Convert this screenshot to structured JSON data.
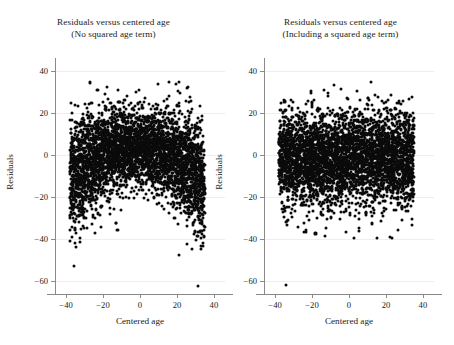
{
  "figure": {
    "background": "#ffffff",
    "point_color": "#0b0b0b",
    "axis_color": "#8a8a8a",
    "grid_color": "#f0eeec"
  },
  "chart_data": [
    {
      "type": "scatter",
      "panel": "left",
      "title": "Residuals versus centered age",
      "subtitle": "(No squared age term)",
      "xlabel": "Centered age",
      "ylabel": "Residuals",
      "xlim": [
        -46,
        46
      ],
      "ylim": [
        -66,
        46
      ],
      "xticks": [
        -40,
        -20,
        0,
        20,
        40
      ],
      "xticklabels": [
        "−40",
        "−20",
        "0",
        "20",
        "40"
      ],
      "yticks": [
        -60,
        -40,
        -20,
        0,
        20,
        40
      ],
      "yticklabels": [
        "−60",
        "−40",
        "−20",
        "0",
        "20",
        "40"
      ],
      "grid": "horizontal",
      "legend": "none",
      "n_points_approx": 4000,
      "x_data_range": [
        -38,
        35
      ],
      "description": "Dense black point cloud spanning centered age -38 to 35. Residual spread is asymmetric: the lower boundary of the cloud is arched (inverted-U), reaching about -50 near the edges and only about -18 near the centre, indicating an unmodelled quadratic age effect. Upper boundary rises to roughly +25 to +45. A few isolated low outliers near -60.",
      "shape": "arched",
      "upper_edge_centre": 24,
      "upper_edge_edges": 14,
      "lower_edge_centre": -17,
      "lower_edge_edges": -47,
      "min_residual": -60,
      "max_residual": 45
    },
    {
      "type": "scatter",
      "panel": "right",
      "title": "Residuals versus centered age",
      "subtitle": "(Including a squared age term)",
      "xlabel": "Centered age",
      "ylabel": "Residuals",
      "xlim": [
        -46,
        46
      ],
      "ylim": [
        -66,
        46
      ],
      "xticks": [
        -40,
        -20,
        0,
        20,
        40
      ],
      "xticklabels": [
        "−40",
        "−20",
        "0",
        "20",
        "40"
      ],
      "yticks": [
        -60,
        -40,
        -20,
        0,
        20,
        40
      ],
      "yticklabels": [
        "−60",
        "−40",
        "−20",
        "0",
        "20",
        "40"
      ],
      "grid": "horizontal",
      "legend": "none",
      "n_points_approx": 4000,
      "x_data_range": [
        -38,
        35
      ],
      "description": "Dense black point cloud spanning centered age -38 to 35 with a flat, uniform band of residuals across the whole age range, roughly -25 to +25 for the bulk, with scattered outliers down to about -55 and up to about +44. No systematic curvature remains.",
      "shape": "uniform",
      "upper_edge_centre": 22,
      "upper_edge_edges": 22,
      "lower_edge_centre": -24,
      "lower_edge_edges": -24,
      "min_residual": -55,
      "max_residual": 44
    }
  ]
}
